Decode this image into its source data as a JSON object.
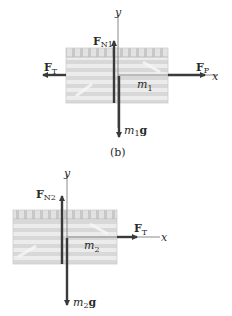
{
  "colors": {
    "arrow": "#3a3a3a",
    "axis": "#8a8a8a",
    "block_light": "#ececec",
    "block_dark": "#d6d6d6",
    "block_top": "#cfcfcf",
    "text": "#2a2a2a"
  },
  "diagram_top": {
    "caption": "(b)",
    "axis_y_label": "y",
    "axis_x_label": "x",
    "normal_force": {
      "main": "F",
      "sub": "N1"
    },
    "tension": {
      "main": "F",
      "sub": "T"
    },
    "push": {
      "main": "F",
      "sub": "P"
    },
    "mass": {
      "main": "m",
      "sub": "1"
    },
    "weight": {
      "main": "m",
      "sub": "1",
      "suffix": "g"
    }
  },
  "diagram_bottom": {
    "axis_y_label": "y",
    "axis_x_label": "x",
    "normal_force": {
      "main": "F",
      "sub": "N2"
    },
    "tension": {
      "main": "F",
      "sub": "T"
    },
    "mass": {
      "main": "m",
      "sub": "2"
    },
    "weight": {
      "main": "m",
      "sub": "2",
      "suffix": "g"
    }
  }
}
